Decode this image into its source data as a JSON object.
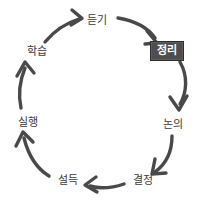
{
  "diagram": {
    "type": "cycle",
    "direction": "clockwise",
    "background_color": "#ffffff",
    "arrow_color": "#4a4a4a",
    "label_color": "#3b3b3b",
    "highlight_background": "#4e4e4e",
    "highlight_text_color": "#ffffff",
    "highlight_border_color": "#2e2e2e",
    "nodes": [
      {
        "id": "listening",
        "label": "듣기",
        "x": 97,
        "y": 20,
        "highlighted": false
      },
      {
        "id": "organizing",
        "label": "정리",
        "x": 167,
        "y": 51,
        "highlighted": true
      },
      {
        "id": "discussion",
        "label": "논의",
        "x": 173,
        "y": 124,
        "highlighted": false
      },
      {
        "id": "decision",
        "label": "결정",
        "x": 143,
        "y": 180,
        "highlighted": false
      },
      {
        "id": "persuasion",
        "label": "설득",
        "x": 68,
        "y": 180,
        "highlighted": false
      },
      {
        "id": "execution",
        "label": "실행",
        "x": 28,
        "y": 122,
        "highlighted": false
      },
      {
        "id": "learning",
        "label": "학습",
        "x": 37,
        "y": 51,
        "highlighted": false
      }
    ],
    "edges": [
      {
        "from": "learning",
        "to": "listening"
      },
      {
        "from": "listening",
        "to": "organizing"
      },
      {
        "from": "organizing",
        "to": "discussion"
      },
      {
        "from": "discussion",
        "to": "decision"
      },
      {
        "from": "decision",
        "to": "persuasion"
      },
      {
        "from": "persuasion",
        "to": "execution"
      },
      {
        "from": "execution",
        "to": "learning"
      }
    ]
  }
}
